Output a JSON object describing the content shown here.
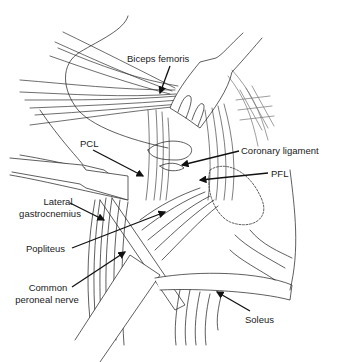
{
  "figure": {
    "type": "anatomical-illustration",
    "stroke_color": "#1a1a1a",
    "background": "#ffffff"
  },
  "labels": [
    {
      "id": "biceps-femoris",
      "text": "Biceps femoris",
      "x": 127,
      "y": 53,
      "align": "left",
      "arrow": {
        "x1": 170,
        "y1": 66,
        "x2": 160,
        "y2": 93
      }
    },
    {
      "id": "pcl",
      "text": "PCL",
      "x": 80,
      "y": 138,
      "align": "left",
      "arrow": {
        "x1": 93,
        "y1": 150,
        "x2": 143,
        "y2": 176
      }
    },
    {
      "id": "coronary-ligament",
      "text": "Coronary ligament",
      "x": 241,
      "y": 145,
      "align": "left",
      "arrow": {
        "x1": 239,
        "y1": 151,
        "x2": 182,
        "y2": 165
      }
    },
    {
      "id": "pfl",
      "text": "PFL",
      "x": 271,
      "y": 168,
      "align": "left",
      "arrow": {
        "x1": 268,
        "y1": 173,
        "x2": 200,
        "y2": 180
      }
    },
    {
      "id": "lateral-gastrocnemius-1",
      "text": "Lateral",
      "x": 33,
      "y": 196,
      "align": "center",
      "width": 50
    },
    {
      "id": "lateral-gastrocnemius-2",
      "text": "gastrocnemius",
      "x": 15,
      "y": 208,
      "align": "center",
      "width": 70,
      "arrow": {
        "x1": 70,
        "y1": 203,
        "x2": 104,
        "y2": 220
      }
    },
    {
      "id": "popliteus",
      "text": "Popliteus",
      "x": 26,
      "y": 243,
      "align": "left",
      "arrow": {
        "x1": 72,
        "y1": 248,
        "x2": 165,
        "y2": 212
      }
    },
    {
      "id": "common-peroneal-nerve-1",
      "text": "Common",
      "x": 27,
      "y": 282,
      "align": "center",
      "width": 42
    },
    {
      "id": "common-peroneal-nerve-2",
      "text": "peroneal nerve",
      "x": 12,
      "y": 294,
      "align": "center",
      "width": 70,
      "arrow": {
        "x1": 72,
        "y1": 287,
        "x2": 125,
        "y2": 252
      }
    },
    {
      "id": "soleus",
      "text": "Soleus",
      "x": 245,
      "y": 314,
      "align": "left",
      "arrow": {
        "x1": 250,
        "y1": 311,
        "x2": 217,
        "y2": 292
      }
    }
  ]
}
